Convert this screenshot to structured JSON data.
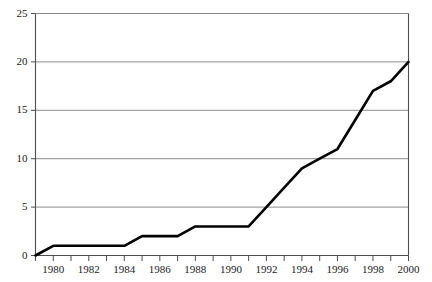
{
  "chart_data": {
    "type": "line",
    "title": "",
    "subtitle": "",
    "xlabel": "",
    "ylabel": "",
    "xlim": [
      1979,
      2000
    ],
    "ylim": [
      0,
      25
    ],
    "grid": true,
    "legend": null,
    "x_tick_labels": [
      "1980",
      "1982",
      "1984",
      "1986",
      "1988",
      "1990",
      "1992",
      "1994",
      "1996",
      "1998",
      "2000"
    ],
    "x_tick_values": [
      1980,
      1982,
      1984,
      1986,
      1988,
      1990,
      1992,
      1994,
      1996,
      1998,
      2000
    ],
    "x_minor_tick_values": [
      1979,
      1981,
      1983,
      1985,
      1987,
      1989,
      1991,
      1993,
      1995,
      1997,
      1999
    ],
    "y_tick_labels": [
      "0",
      "5",
      "10",
      "15",
      "20",
      "25"
    ],
    "y_tick_values": [
      0,
      5,
      10,
      15,
      20,
      25
    ],
    "series": [
      {
        "name": "series-1",
        "color": "#000000",
        "line_width": 2.6,
        "x": [
          1979,
          1980,
          1984,
          1985,
          1987,
          1988,
          1991,
          1992,
          1993,
          1994,
          1995,
          1996,
          1997,
          1998,
          1999,
          2000
        ],
        "values": [
          0,
          1,
          1,
          2,
          2,
          3,
          3,
          5,
          7,
          9,
          10,
          11,
          14,
          17,
          18,
          20
        ]
      }
    ],
    "colors": {
      "line": "#000000",
      "grid": "#8c8c8c",
      "axis": "#4d4d4d",
      "text": "#1a1a1a",
      "background": "#ffffff"
    }
  }
}
